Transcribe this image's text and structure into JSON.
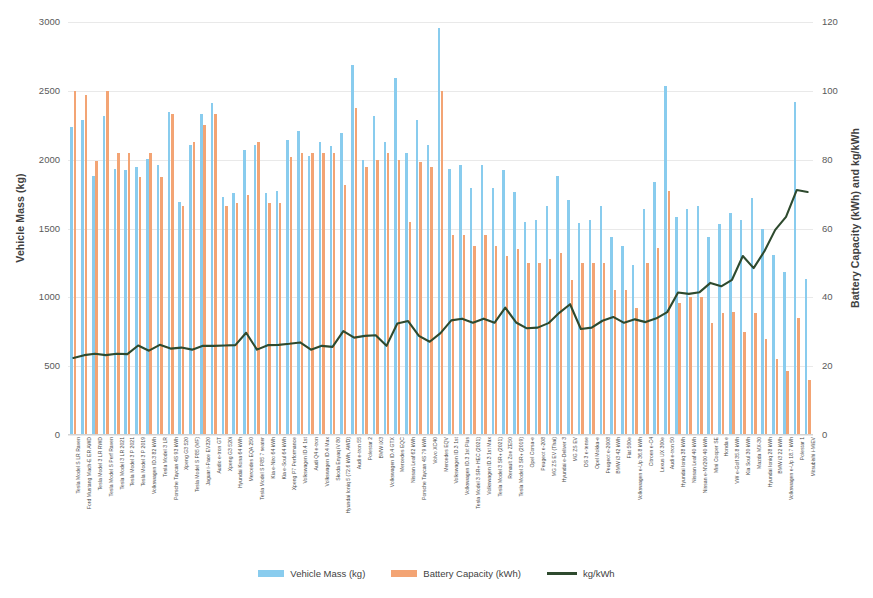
{
  "chart_data": {
    "type": "bar",
    "title": "",
    "subtitle": "",
    "xlabel": "",
    "ylabel": "Vehicle Mass (kg)",
    "y2label": "Battery Capacity (kWh) and kg/kWh",
    "ylim": [
      0,
      3000
    ],
    "y2lim": [
      0,
      120
    ],
    "yticks": [
      "0",
      "500",
      "1000",
      "1500",
      "2000",
      "2500",
      "3000"
    ],
    "y2ticks": [
      "0",
      "20",
      "40",
      "60",
      "80",
      "100",
      "120"
    ],
    "grid": true,
    "legend_position": "bottom",
    "legend": [
      {
        "label": "Vehicle Mass (kg)",
        "color": "#89ccee",
        "kind": "bar"
      },
      {
        "label": "Battery Capacity (kWh)",
        "color": "#f3a474",
        "kind": "bar"
      },
      {
        "label": "kg/kWh",
        "color": "#2e4a2e",
        "kind": "line"
      }
    ],
    "categories": [
      "Tesla Model S LR Raven",
      "Ford Mustang Mach-E ER AWD",
      "Tesla Model 3 LR RWD",
      "Tesla Model S Perf Raven",
      "Tesla Model 3 LR 2021",
      "Tesla Model 3 P 2021",
      "Tesla Model 3 P 2019",
      "Volkswagen ID.3 82 kWh",
      "Tesla Model 3 LR",
      "Porsche Taycan 4S 93 kWh",
      "Xpeng G3 520",
      "Tesla Model S P85 (MF)",
      "Jaguar i-Pace EV320",
      "Audio e-tron GT",
      "Xpeng G3 520i",
      "Hyundai Kona 64 kWh",
      "Mercedes EQA 250",
      "Tesla Model S P85 7 seater",
      "Kia e-Niro 64 kWh",
      "Kia e-Soul 64 kWh",
      "Xpeng P7 Performance",
      "Volkswagen ID.4 1st",
      "Audi Q4 e-tron",
      "Volkswagen ID.4 Max",
      "Skoda Enyaq iV 80",
      "Hyundai Ioniq 5 (72.6 kWh, AWD)",
      "Audi e-tron 55",
      "Polestar 2",
      "BMW iX3",
      "Volkswagen ID.4 GTX",
      "Mercedes EQC",
      "Nissan Leaf 62 kWh",
      "Porsche Taycan 4S 79 kWh",
      "Volvo XC40",
      "Mercedes EQV",
      "Volkswagen ID.3 1st",
      "Volkswagen ID.3 1st Plus",
      "Tesla Model 3 SR+ HEC (2021)",
      "Volkswagen ID.3 1st Max",
      "Tesla Model 3 SR+ (2021)",
      "Renault Zoe ZE50",
      "Tesla Model 3 SR+ (2019)",
      "Opel Corsa-e",
      "Peugeot e-208",
      "MG ZS EV (Thai)",
      "Hyundai e-Deliver 3",
      "MG ZS EV",
      "DS 3 e-tense",
      "Opel Mokka-e",
      "Peugeot e-2008",
      "BMW i3 42 kWh",
      "Fiat 500e",
      "Volkswagen e-Up 36.8 kWh",
      "Citroen e-C4",
      "Lexus UX 300e",
      "Audi e-tron 50",
      "Hyundai Ioniq 38 kWh",
      "Nissan Leaf 40 kWh",
      "Nissan e-NV200 40 kWh",
      "Mini Cooper SE",
      "Honda e",
      "VW e-Golf 35.8 kWh",
      "Kia Soul 30 kWh",
      "Mazda MX-30",
      "Hyundai Ioniq 28 kWh",
      "BMW i3 22 kWh",
      "Volkswagen e-Up 18.7 kWh",
      "Polestar 1",
      "Mitsubishi i-MiEV"
    ],
    "series": [
      {
        "name": "Vehicle Mass (kg)",
        "axis": "left",
        "color": "#89ccee",
        "values": [
          2241,
          2290,
          1880,
          2316,
          1935,
          1925,
          1950,
          2005,
          1965,
          2345,
          1690,
          2108,
          2330,
          2415,
          1730,
          1760,
          2070,
          2105,
          1760,
          1770,
          2145,
          2205,
          2030,
          2125,
          2100,
          2195,
          2690,
          2000,
          2320,
          2125,
          2595,
          2050,
          2285,
          2110,
          2955,
          1930,
          1960,
          1795,
          1960,
          1795,
          1925,
          1765,
          1550,
          1560,
          1660,
          1880,
          1710,
          1540,
          1560,
          1660,
          1440,
          1370,
          1235,
          1640,
          1840,
          2535,
          1585,
          1640,
          1660,
          1440,
          1535,
          1615,
          1560,
          1720,
          1495,
          1310,
          1185,
          2420,
          1130
        ]
      },
      {
        "name": "Battery Capacity (kWh)",
        "axis": "right",
        "color": "#f3a474",
        "values": [
          100,
          98.8,
          79.5,
          100,
          82,
          82,
          75,
          82,
          75,
          93.4,
          66.5,
          85,
          90,
          93.4,
          66.5,
          67.5,
          69.7,
          85,
          67.5,
          67.5,
          80.9,
          82,
          82,
          82,
          82,
          72.6,
          95,
          78,
          80,
          82,
          80,
          62,
          79.2,
          78,
          100,
          58,
          58,
          55,
          58,
          55,
          52,
          54,
          50,
          50,
          51,
          53,
          45,
          50,
          50,
          50,
          42,
          42,
          36.8,
          50,
          54.3,
          71,
          38.3,
          40,
          40,
          32.6,
          35.5,
          35.8,
          30,
          35.5,
          28,
          22,
          18.7,
          34,
          16
        ]
      },
      {
        "name": "kg/kWh",
        "axis": "right",
        "color": "#2e4a2e",
        "values": [
          22.4,
          23.2,
          23.6,
          23.2,
          23.6,
          23.5,
          26.0,
          24.5,
          26.2,
          25.1,
          25.4,
          24.8,
          25.9,
          25.9,
          26.0,
          26.1,
          29.7,
          24.8,
          26.1,
          26.2,
          26.5,
          26.9,
          24.8,
          25.9,
          25.6,
          30.2,
          28.3,
          28.8,
          29.0,
          25.9,
          32.4,
          33.1,
          28.8,
          27.1,
          29.6,
          33.3,
          33.8,
          32.6,
          33.8,
          32.6,
          37.0,
          32.7,
          31.0,
          31.2,
          32.5,
          35.5,
          38.0,
          30.8,
          31.2,
          33.2,
          34.3,
          32.6,
          33.6,
          32.8,
          33.9,
          35.7,
          41.4,
          41.0,
          41.5,
          44.2,
          43.2,
          45.1,
          52.0,
          48.5,
          53.4,
          59.6,
          63.4,
          71.2,
          70.6
        ]
      }
    ]
  }
}
